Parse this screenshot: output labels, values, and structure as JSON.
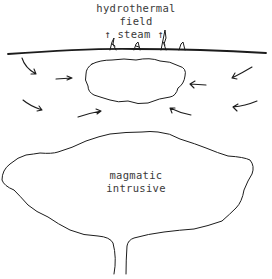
{
  "diagram": {
    "title_line1": "hydrothermal",
    "title_line2": "field",
    "steam_label": "↑ steam ↑",
    "intrusion_line1": "magmatic",
    "intrusion_line2": "intrusive",
    "colors": {
      "ink": "#1c1c1c",
      "text": "#3a3a3a",
      "background": "#ffffff"
    },
    "elements": {
      "ground_surface": "horizontal surface line",
      "vents": 4,
      "inflow_arrows_left": 4,
      "inflow_arrows_right": 4,
      "steam_zone": "irregular cloud-shaped outline",
      "magma_body": "mushroom-shaped intrusion with feeder conduit"
    }
  }
}
